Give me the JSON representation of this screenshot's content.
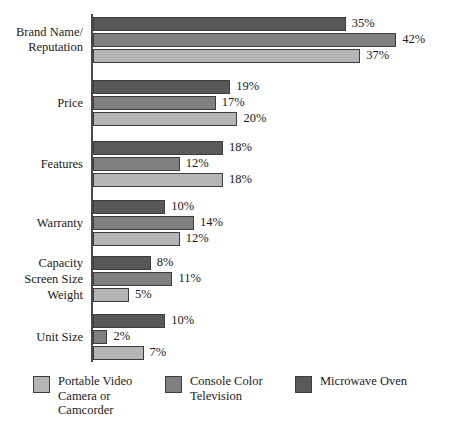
{
  "chart_data": {
    "type": "bar",
    "orientation": "horizontal",
    "title": "",
    "xlabel": "",
    "ylabel": "",
    "grid": false,
    "axis_visible": true,
    "xlim": [
      0,
      42
    ],
    "value_suffix": "%",
    "legend_position": "bottom",
    "categories": [
      "Brand Name/\nReputation",
      "Price",
      "Features",
      "Warranty",
      "Capacity / Screen Size / Weight",
      "Unit Size"
    ],
    "series": [
      {
        "name": "Microwave Oven",
        "color": "#595959",
        "values": [
          35,
          19,
          18,
          10,
          8,
          10
        ],
        "labels": [
          "35%",
          "19%",
          "18%",
          "10%",
          "8%",
          "10%"
        ]
      },
      {
        "name": "Console Color Television",
        "color": "#808080",
        "values": [
          42,
          17,
          12,
          14,
          11,
          2
        ],
        "labels": [
          "42%",
          "17%",
          "12%",
          "14%",
          "11%",
          "2%"
        ]
      },
      {
        "name": "Portable Video Camera or Camcorder",
        "color": "#b5b5b5",
        "values": [
          37,
          20,
          18,
          12,
          5,
          7
        ],
        "labels": [
          "37%",
          "20%",
          "18%",
          "12%",
          "5%",
          "7%"
        ]
      }
    ]
  },
  "groups": [
    {
      "label_lines": [
        "Brand Name/",
        "Reputation"
      ],
      "label_name": "brand-name-reputation",
      "bars": [
        {
          "series": "Microwave Oven",
          "value": 35,
          "label": "35%"
        },
        {
          "series": "Console Color Television",
          "value": 42,
          "label": "42%"
        },
        {
          "series": "Portable Video Camera or Camcorder",
          "value": 37,
          "label": "37%"
        }
      ]
    },
    {
      "label_lines": [
        "Price"
      ],
      "label_name": "price",
      "bars": [
        {
          "series": "Microwave Oven",
          "value": 19,
          "label": "19%"
        },
        {
          "series": "Console Color Television",
          "value": 17,
          "label": "17%"
        },
        {
          "series": "Portable Video Camera or Camcorder",
          "value": 20,
          "label": "20%"
        }
      ]
    },
    {
      "label_lines": [
        "Features"
      ],
      "label_name": "features",
      "bars": [
        {
          "series": "Microwave Oven",
          "value": 18,
          "label": "18%"
        },
        {
          "series": "Console Color Television",
          "value": 12,
          "label": "12%"
        },
        {
          "series": "Portable Video Camera or Camcorder",
          "value": 18,
          "label": "18%"
        }
      ]
    },
    {
      "label_lines": [
        "Warranty"
      ],
      "label_name": "warranty",
      "bars": [
        {
          "series": "Microwave Oven",
          "value": 10,
          "label": "10%"
        },
        {
          "series": "Console Color Television",
          "value": 14,
          "label": "14%"
        },
        {
          "series": "Portable Video Camera or Camcorder",
          "value": 12,
          "label": "12%"
        }
      ]
    },
    {
      "label_lines": [
        "Capacity",
        "Screen Size",
        "Weight"
      ],
      "label_name": "capacity-screen-size-weight",
      "bars": [
        {
          "series": "Microwave Oven",
          "value": 8,
          "label": "8%"
        },
        {
          "series": "Console Color Television",
          "value": 11,
          "label": "11%"
        },
        {
          "series": "Portable Video Camera or Camcorder",
          "value": 5,
          "label": "5%"
        }
      ]
    },
    {
      "label_lines": [
        "Unit Size"
      ],
      "label_name": "unit-size",
      "bars": [
        {
          "series": "Microwave Oven",
          "value": 10,
          "label": "10%"
        },
        {
          "series": "Console Color Television",
          "value": 2,
          "label": "2%"
        },
        {
          "series": "Portable Video Camera or Camcorder",
          "value": 7,
          "label": "7%"
        }
      ]
    }
  ],
  "legend": {
    "items": [
      {
        "name": "portable-video-camera-or-camcorder",
        "lines": [
          "Portable Video",
          "Camera or",
          "Camcorder"
        ],
        "color": "#b5b5b5"
      },
      {
        "name": "console-color-television",
        "lines": [
          "Console Color",
          "Television"
        ],
        "color": "#808080"
      },
      {
        "name": "microwave-oven",
        "lines": [
          "Microwave Oven"
        ],
        "color": "#595959"
      }
    ]
  }
}
